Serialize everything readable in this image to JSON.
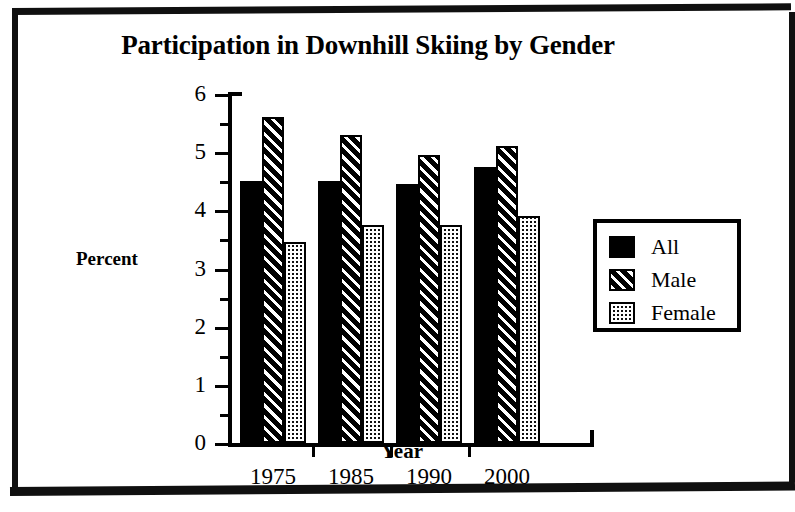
{
  "chart_data": {
    "type": "bar",
    "title": "Participation in Downhill Skiing by Gender",
    "xlabel": "Year",
    "ylabel": "Percent",
    "categories": [
      "1975",
      "1985",
      "1990",
      "2000"
    ],
    "series": [
      {
        "name": "All",
        "values": [
          4.5,
          4.5,
          4.45,
          4.75
        ],
        "fill": "solid"
      },
      {
        "name": "Male",
        "values": [
          5.6,
          5.3,
          4.95,
          5.1
        ],
        "fill": "diagonal-hatch"
      },
      {
        "name": "Female",
        "values": [
          3.45,
          3.75,
          3.75,
          3.9
        ],
        "fill": "dotted-checker"
      }
    ],
    "ylim": [
      0,
      6
    ],
    "ytick_major": [
      "0",
      "1",
      "2",
      "3",
      "4",
      "5",
      "6"
    ],
    "ytick_minor": [
      0.5,
      1.5,
      2.5,
      3.5,
      4.5,
      5.5
    ],
    "grid": false,
    "legend_position": "right",
    "colors": {
      "ink": "#000000",
      "paper": "#ffffff"
    }
  },
  "legend": {
    "items": [
      {
        "label": "All"
      },
      {
        "label": "Male"
      },
      {
        "label": "Female"
      }
    ]
  }
}
